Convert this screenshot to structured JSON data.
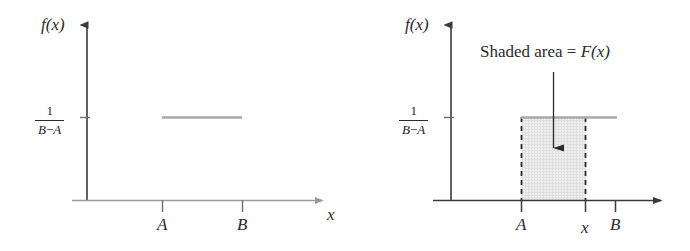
{
  "figure": {
    "background_color": "#ffffff",
    "axis_color_left": "#8a8a8a",
    "axis_color_right": "#3a3a3a",
    "density_line_color": "#a8a8a8",
    "shade_fill_color": "#ededed",
    "dash_color": "#2b2b2b",
    "text_color": "#2b2b2b"
  },
  "panels": [
    {
      "id": "left",
      "name": "uniform-density-plot",
      "y_axis_label": "f(x)",
      "x_axis_label": "x",
      "y_tick": {
        "numerator": "1",
        "denominator_left": "B",
        "denominator_op": "−",
        "denominator_right": "A"
      },
      "x_ticks": [
        {
          "label": "A",
          "value": "A"
        },
        {
          "label": "B",
          "value": "B"
        }
      ],
      "density_segment": {
        "from": "A",
        "to": "B",
        "height": "1/(B-A)"
      },
      "shaded": false,
      "annotation": null
    },
    {
      "id": "right",
      "name": "uniform-cdf-area-plot",
      "y_axis_label": "f(x)",
      "x_axis_label": "x",
      "y_tick": {
        "numerator": "1",
        "denominator_left": "B",
        "denominator_op": "−",
        "denominator_right": "A"
      },
      "x_ticks": [
        {
          "label": "A",
          "value": "A"
        },
        {
          "label": "x",
          "value": "x"
        },
        {
          "label": "B",
          "value": "B"
        }
      ],
      "density_segment": {
        "from": "A",
        "to": "B",
        "height": "1/(B-A)"
      },
      "shaded": true,
      "shaded_region": {
        "from": "A",
        "to": "x"
      },
      "annotation": {
        "text_plain": "Shaded area = ",
        "text_math": "F(x)",
        "pointer": "down-arrow"
      }
    }
  ]
}
